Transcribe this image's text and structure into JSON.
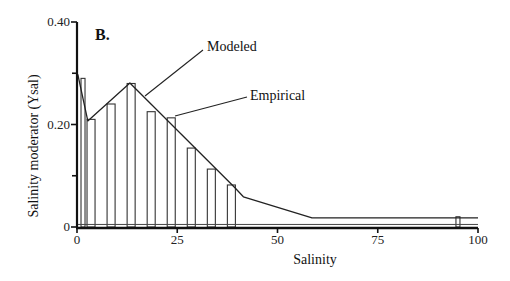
{
  "chart_data": {
    "type": "bar",
    "panel_label": "B.",
    "title": "",
    "xlabel": "Salinity",
    "ylabel": "Salinity moderator (Ysal)",
    "xlim": [
      0,
      100
    ],
    "ylim": [
      0,
      0.4
    ],
    "x_ticks": [
      "0",
      "25",
      "50",
      "75",
      "100"
    ],
    "x_tick_values": [
      0,
      25,
      50,
      75,
      100
    ],
    "y_ticks": [
      "0",
      "0.20",
      "0.40"
    ],
    "y_tick_values": [
      0,
      0.2,
      0.4
    ],
    "y_minor_ticks": [
      0.1,
      0.3
    ],
    "grid": false,
    "legend": "annotations",
    "annotations": [
      {
        "text": "Modeled",
        "target": "modeled"
      },
      {
        "text": "Empirical",
        "target": "empirical"
      }
    ],
    "series": [
      {
        "name": "Empirical",
        "kind": "bar",
        "bars": [
          {
            "x_start": 1,
            "x_end": 2,
            "value": 0.29
          },
          {
            "x_start": 2.5,
            "x_end": 4.5,
            "value": 0.21
          },
          {
            "x_start": 7.5,
            "x_end": 9.5,
            "value": 0.24
          },
          {
            "x_start": 12.5,
            "x_end": 14.5,
            "value": 0.28
          },
          {
            "x_start": 17.5,
            "x_end": 19.5,
            "value": 0.225
          },
          {
            "x_start": 22.5,
            "x_end": 24.5,
            "value": 0.213
          },
          {
            "x_start": 27.5,
            "x_end": 29.5,
            "value": 0.154
          },
          {
            "x_start": 32.5,
            "x_end": 34.5,
            "value": 0.113
          },
          {
            "x_start": 37.5,
            "x_end": 39.5,
            "value": 0.082
          },
          {
            "x_start": 94.5,
            "x_end": 95.5,
            "value": 0.02
          }
        ],
        "baseline_after_40": 0.005
      },
      {
        "name": "Modeled",
        "kind": "line",
        "x": [
          0.2,
          2.7,
          13.2,
          39.2,
          41.5,
          58.6,
          100
        ],
        "values": [
          0.298,
          0.207,
          0.281,
          0.078,
          0.059,
          0.018,
          0.018
        ]
      }
    ]
  }
}
